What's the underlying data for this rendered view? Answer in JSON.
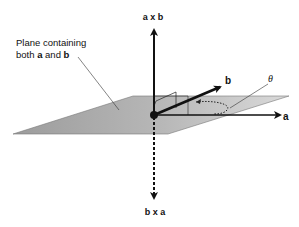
{
  "diagram": {
    "plane_label_line1": "Plane containing",
    "plane_label_line2_prefix": "both ",
    "plane_label_a": "a",
    "plane_label_and": " and ",
    "plane_label_b": "b",
    "up_vector_label": "a x b",
    "down_vector_label": "b x a",
    "vector_a_label": "a",
    "vector_b_label": "b",
    "angle_label": "θ",
    "colors": {
      "plane_dark": "#9a9a9a",
      "plane_light": "#d6d6d6",
      "stroke": "#111111",
      "background": "#ffffff"
    }
  }
}
